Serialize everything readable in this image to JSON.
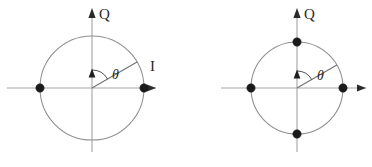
{
  "figure": {
    "type": "constellation-diagrams",
    "background_color": "#ffffff",
    "axis_color": "#a8a8a8",
    "circle_color": "#8e8e8e",
    "dot_color": "#1a1a1a",
    "label_color": "#2a2a2a",
    "caption": "",
    "panels": [
      {
        "id": "left",
        "name": "bpsk-constellation",
        "center_x": 92,
        "center_y": 88,
        "radius": 52,
        "q_axis_label": "Q",
        "i_axis_label": "I",
        "angle_label": "θ",
        "angle_degrees": 30,
        "point_count": 2,
        "points": [
          {
            "name": "point-0deg",
            "angle": 0,
            "x": 144,
            "y": 88
          },
          {
            "name": "point-180deg",
            "angle": 180,
            "x": 40,
            "y": 88
          }
        ]
      },
      {
        "id": "right",
        "name": "qpsk-constellation",
        "center_x": 297,
        "center_y": 88,
        "radius": 46,
        "q_axis_label": "Q",
        "i_axis_label": "",
        "angle_label": "θ",
        "angle_degrees": 30,
        "point_count": 4,
        "points": [
          {
            "name": "point-0deg",
            "angle": 0,
            "x": 343,
            "y": 88
          },
          {
            "name": "point-90deg",
            "angle": 90,
            "x": 297,
            "y": 42
          },
          {
            "name": "point-180deg",
            "angle": 180,
            "x": 251,
            "y": 88
          },
          {
            "name": "point-270deg",
            "angle": 270,
            "x": 297,
            "y": 134
          }
        ]
      }
    ],
    "sublabels": [
      {
        "name": "caption-fragment-left",
        "text": "",
        "x": 84,
        "y": 158
      },
      {
        "name": "caption-fragment-mid",
        "text": "",
        "x": 176,
        "y": 158
      },
      {
        "name": "caption-fragment-right",
        "text": "",
        "x": 288,
        "y": 158
      }
    ]
  }
}
